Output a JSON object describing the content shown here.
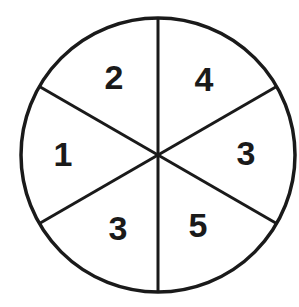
{
  "diagram": {
    "type": "spinner",
    "sections": 6,
    "labels": [
      {
        "position": "top-left",
        "value": "2"
      },
      {
        "position": "top-right",
        "value": "4"
      },
      {
        "position": "right",
        "value": "3"
      },
      {
        "position": "bottom-right",
        "value": "5"
      },
      {
        "position": "bottom-left",
        "value": "3"
      },
      {
        "position": "left",
        "value": "1"
      }
    ],
    "colors": {
      "stroke": "#1a1a1a",
      "fill": "#ffffff"
    }
  }
}
